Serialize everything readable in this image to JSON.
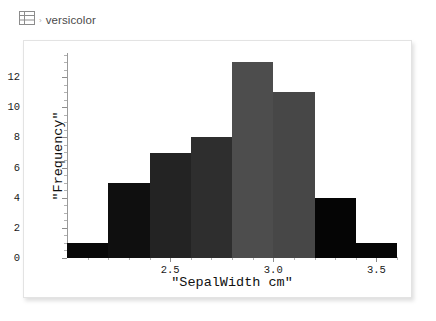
{
  "header": {
    "icon": "table-icon",
    "separator": "›",
    "label": "versicolor"
  },
  "chart_data": {
    "type": "bar",
    "title": "",
    "xlabel": "\"SepalWidth cm\"",
    "ylabel": "\"Frequency\"",
    "xlim": [
      2.0,
      3.6
    ],
    "ylim": [
      0,
      13.6
    ],
    "grid": false,
    "legend": null,
    "bin_width": 0.2,
    "bin_edges": [
      2.0,
      2.2,
      2.4,
      2.6,
      2.8,
      3.0,
      3.2,
      3.4,
      3.6
    ],
    "categories": [
      "2.0-2.2",
      "2.2-2.4",
      "2.4-2.6",
      "2.6-2.8",
      "2.8-3.0",
      "3.0-3.2",
      "3.2-3.4",
      "3.4-3.6"
    ],
    "values": [
      1,
      5,
      7,
      8,
      13,
      11,
      4,
      1
    ],
    "bar_colors": [
      "#080808",
      "#0f0f0f",
      "#232323",
      "#2e2e2e",
      "#4d4d4d",
      "#474747",
      "#050505",
      "#050505"
    ],
    "xticks": [
      {
        "value": 2.5,
        "label": "2.5"
      },
      {
        "value": 3.0,
        "label": "3.0"
      },
      {
        "value": 3.5,
        "label": "3.5"
      }
    ],
    "xticks_minor": [
      2.1,
      2.2,
      2.3,
      2.4,
      2.6,
      2.7,
      2.8,
      2.9,
      3.1,
      3.2,
      3.3,
      3.4,
      3.6
    ],
    "yticks": [
      {
        "value": 0,
        "label": "0"
      },
      {
        "value": 2,
        "label": "2"
      },
      {
        "value": 4,
        "label": "4"
      },
      {
        "value": 6,
        "label": "6"
      },
      {
        "value": 8,
        "label": "8"
      },
      {
        "value": 10,
        "label": "10"
      },
      {
        "value": 12,
        "label": "12"
      }
    ],
    "yticks_minor": [
      0.5,
      1,
      1.5,
      2.5,
      3,
      3.5,
      4.5,
      5,
      5.5,
      6.5,
      7,
      7.5,
      8.5,
      9,
      9.5,
      10.5,
      11,
      11.5,
      12.5,
      13,
      13.5
    ],
    "axis_color": "#9a9a9a",
    "frame_border_color": "#e3e3e3",
    "background": "#ffffff"
  }
}
